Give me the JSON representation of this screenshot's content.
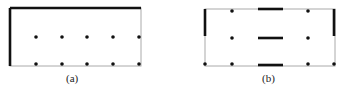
{
  "panels": [
    {
      "label": "(a)",
      "box": {
        "x": 10,
        "y": 8,
        "w": 131,
        "h": 58
      },
      "thick_edges": [
        {
          "x1": 10,
          "y1": 8,
          "x2": 141,
          "y2": 8
        },
        {
          "x1": 10,
          "y1": 8,
          "x2": 10,
          "y2": 66
        }
      ],
      "dots": [
        [
          36,
          37
        ],
        [
          62,
          37
        ],
        [
          87,
          37
        ],
        [
          113,
          37
        ],
        [
          139,
          37
        ],
        [
          36,
          64
        ],
        [
          62,
          64
        ],
        [
          87,
          64
        ],
        [
          113,
          64
        ],
        [
          139,
          64
        ]
      ],
      "label_pos": {
        "x": 66,
        "y": 72
      }
    },
    {
      "label": "(b)",
      "box": {
        "x": 205,
        "y": 9,
        "w": 130,
        "h": 57
      },
      "thick_edges": [
        {
          "x1": 205,
          "y1": 9,
          "x2": 205,
          "y2": 36
        },
        {
          "x1": 334,
          "y1": 9,
          "x2": 334,
          "y2": 36
        },
        {
          "x1": 258,
          "y1": 9,
          "x2": 283,
          "y2": 9
        },
        {
          "x1": 258,
          "y1": 38,
          "x2": 283,
          "y2": 38
        },
        {
          "x1": 258,
          "y1": 65,
          "x2": 283,
          "y2": 65
        }
      ],
      "dots": [
        [
          232,
          11
        ],
        [
          308,
          11
        ],
        [
          232,
          38
        ],
        [
          308,
          38
        ],
        [
          205,
          64
        ],
        [
          232,
          64
        ],
        [
          308,
          64
        ],
        [
          334,
          64
        ]
      ],
      "label_pos": {
        "x": 262,
        "y": 72
      }
    }
  ],
  "colors": {
    "thin": "#aaaaaa",
    "thick": "#111111",
    "dot": "#111111"
  }
}
